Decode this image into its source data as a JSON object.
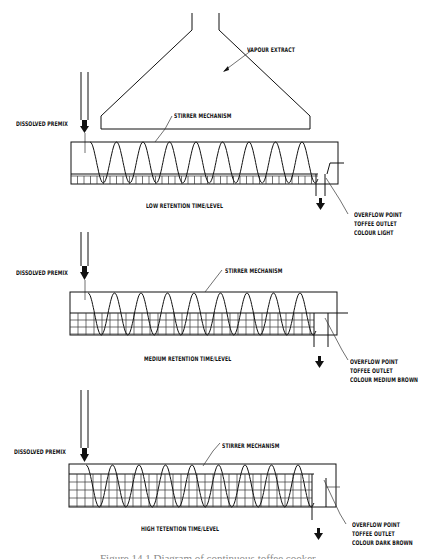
{
  "figure": {
    "caption": "Figure 14.1  Diagram of continuous toffee cooker"
  },
  "hood": {
    "label": "VAPOUR EXTRACT"
  },
  "panels": [
    {
      "feed_label": "DISSOLVED PREMIX",
      "stirrer_label": "STIRRER MECHANISM",
      "level_label": "LOW RETENTION TIME/LEVEL",
      "outlet_lines": [
        "OVERFLOW POINT",
        "TOFFEE OUTLET",
        "COLOUR LIGHT"
      ]
    },
    {
      "feed_label": "DISSOLVED PREMIX",
      "stirrer_label": "STIRRER MECHANISM",
      "level_label": "MEDIUM RETENTION TIME/LEVEL",
      "outlet_lines": [
        "OVERFLOW POINT",
        "TOFFEE OUTLET",
        "COLOUR MEDIUM BROWN"
      ]
    },
    {
      "feed_label": "DISSOLVED PREMIX",
      "stirrer_label": "STIRRER MECHANISM",
      "level_label": "HIGH TETENTION TIME/LEVEL",
      "outlet_lines": [
        "OVERFLOW POINT",
        "TOFFEE OUTLET",
        "COLOUR DARK BROWN"
      ]
    }
  ],
  "colors": {
    "line": "#111111",
    "background": "#ffffff"
  }
}
